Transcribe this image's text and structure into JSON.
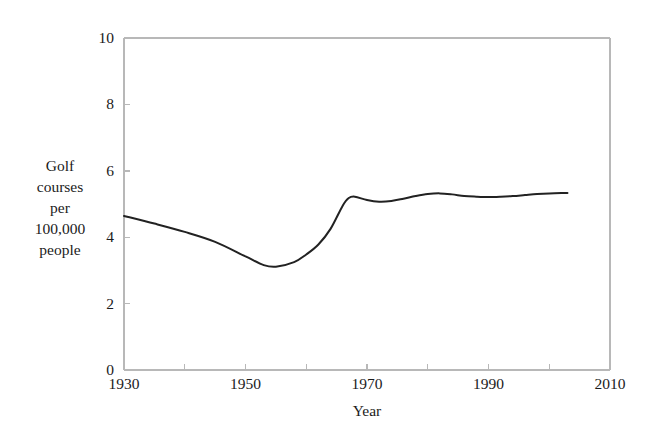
{
  "chart_data": {
    "type": "line",
    "title": "",
    "xlabel": "Year",
    "ylabel": "Golf courses per 100,000 people",
    "ylabel_lines": [
      "Golf",
      "courses",
      "per",
      "100,000",
      "people"
    ],
    "xlim": [
      1930,
      2010
    ],
    "ylim": [
      0,
      10
    ],
    "x_ticks_major": [
      1930,
      1950,
      1970,
      1990,
      2010
    ],
    "x_tick_labels": [
      "1930",
      "1950",
      "1970",
      "1990",
      "2010"
    ],
    "x_ticks_minor": [
      1940,
      1960,
      1980,
      2000
    ],
    "y_ticks": [
      0,
      2,
      4,
      6,
      8,
      10
    ],
    "y_tick_labels": [
      "0",
      "2",
      "4",
      "6",
      "8",
      "10"
    ],
    "grid": false,
    "legend": null,
    "line_color": "#222222",
    "line_width": 2.0,
    "frame_color": "#b8b8b8",
    "background": "#ffffff",
    "series": [
      {
        "name": "Golf courses per 100,000 people",
        "x": [
          1930,
          1935,
          1940,
          1945,
          1950,
          1953,
          1955,
          1958,
          1960,
          1962,
          1964,
          1966,
          1967,
          1968,
          1970,
          1972,
          1974,
          1976,
          1978,
          1980,
          1982,
          1984,
          1986,
          1988,
          1990,
          1992,
          1994,
          1996,
          1998,
          2000,
          2002,
          2003
        ],
        "y": [
          4.64,
          4.41,
          4.16,
          3.86,
          3.42,
          3.16,
          3.11,
          3.25,
          3.48,
          3.78,
          4.25,
          4.95,
          5.18,
          5.22,
          5.12,
          5.07,
          5.09,
          5.16,
          5.24,
          5.3,
          5.32,
          5.29,
          5.24,
          5.22,
          5.21,
          5.22,
          5.24,
          5.27,
          5.3,
          5.32,
          5.33,
          5.33
        ]
      }
    ],
    "annotations": {
      "series_start_value": 4.64,
      "series_min_value": 3.11,
      "series_min_year": 1955,
      "series_end_value": 5.33,
      "series_end_year": 2003
    }
  },
  "axis_geometry": {
    "plot_left_px": 124,
    "plot_right_px": 610,
    "plot_top_px": 38,
    "plot_bottom_px": 370
  }
}
